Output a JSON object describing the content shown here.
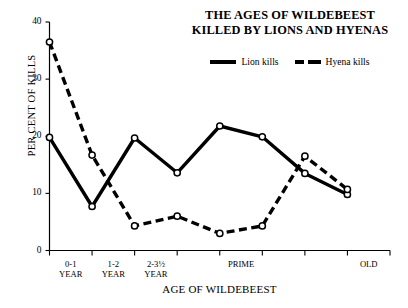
{
  "chart_data": {
    "type": "line",
    "title": "THE AGES OF WILDEBEEST KILLED BY LIONS AND HYENAS",
    "title_line1": "THE AGES OF WILDEBEEST",
    "title_line2": "KILLED BY LIONS AND HYENAS",
    "xlabel": "AGE OF WILDEBEEST",
    "ylabel": "PER CENT OF KILLS",
    "ylim": [
      0,
      40
    ],
    "yticks": [
      0,
      10,
      20,
      30,
      40
    ],
    "grid": false,
    "legend_position": "top-center",
    "x_index": [
      0,
      1,
      2,
      3,
      4,
      5,
      6,
      7,
      8
    ],
    "x_tick_labels": [
      "0-1\nYEAR",
      "1-2\nYEAR",
      "2-3½\nYEAR",
      "PRIME",
      "OLD"
    ],
    "x_tick_label_index": [
      0,
      1,
      2,
      4,
      7
    ],
    "series": [
      {
        "name": "Lion kills",
        "style": "solid",
        "marker": "open-circle",
        "color": "#000000",
        "values": [
          19.8,
          7.7,
          19.7,
          13.6,
          21.8,
          19.9,
          13.5,
          9.8
        ]
      },
      {
        "name": "Hyena kills",
        "style": "dashed",
        "marker": "open-circle",
        "color": "#000000",
        "values": [
          36.5,
          16.7,
          4.3,
          6.0,
          3.0,
          4.3,
          16.5,
          10.7
        ]
      }
    ]
  },
  "legend": {
    "entries": [
      {
        "label": "Lion kills",
        "style": "solid"
      },
      {
        "label": "Hyena kills",
        "style": "dashed"
      }
    ]
  }
}
